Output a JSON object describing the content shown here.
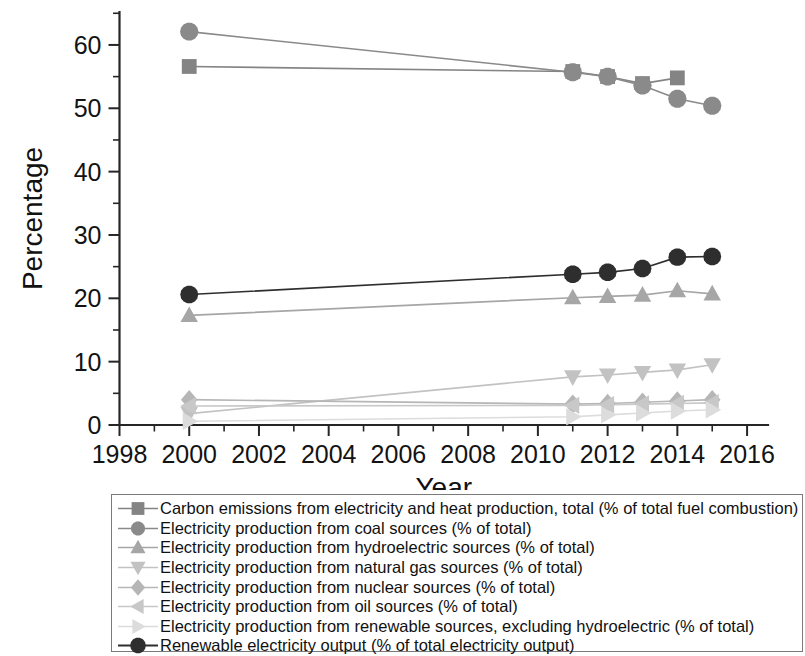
{
  "chart_data": {
    "type": "line",
    "title": "",
    "xlabel": "Year",
    "ylabel": "Percentage",
    "xlim": [
      1998,
      2016.6
    ],
    "ylim": [
      0,
      65.2
    ],
    "xticks": [
      1998,
      2000,
      2002,
      2004,
      2006,
      2008,
      2010,
      2012,
      2014,
      2016
    ],
    "xticklabels": [
      "1998",
      "2000",
      "2002",
      "2004",
      "2006",
      "2008",
      "2010",
      "2012",
      "2014",
      "2016"
    ],
    "xminorticks": [
      1999,
      2001,
      2003,
      2005,
      2007,
      2009,
      2011,
      2013,
      2015
    ],
    "yticks": [
      0,
      10,
      20,
      30,
      40,
      50,
      60
    ],
    "yticklabels": [
      "0",
      "10",
      "20",
      "30",
      "40",
      "50",
      "60"
    ],
    "yminorticks": [
      5,
      15,
      25,
      35,
      45,
      55,
      65
    ],
    "grid": false,
    "legend_position": "below-plot",
    "x": [
      2000,
      2011,
      2012,
      2013,
      2014,
      2015
    ],
    "series": [
      {
        "name": "Carbon emissions from electricity and heat production, total (% of total fuel combustion)",
        "marker": "square",
        "color": "#848484",
        "values": [
          56.6,
          55.8,
          55.0,
          53.9,
          54.8,
          null
        ]
      },
      {
        "name": "Electricity production from coal sources (% of total)",
        "marker": "circle",
        "color": "#8a8a8a",
        "values": [
          62.1,
          55.7,
          55.0,
          53.6,
          51.5,
          50.4
        ]
      },
      {
        "name": "Electricity production from hydroelectric sources (% of total)",
        "marker": "triangle-up",
        "color": "#a6a6a6",
        "values": [
          17.3,
          20.1,
          20.3,
          20.5,
          21.2,
          20.7
        ]
      },
      {
        "name": "Electricity production from natural gas sources (% of total)",
        "marker": "triangle-down",
        "color": "#c2c2c2",
        "values": [
          1.8,
          7.6,
          7.9,
          8.3,
          8.7,
          9.5
        ]
      },
      {
        "name": "Electricity production from nuclear sources (% of total)",
        "marker": "diamond",
        "color": "#b6b6b6",
        "values": [
          4.0,
          3.3,
          3.4,
          3.6,
          3.8,
          4.0
        ]
      },
      {
        "name": "Electricity production from oil sources (% of total)",
        "marker": "triangle-left",
        "color": "#c8c8c8",
        "values": [
          3.0,
          3.1,
          3.2,
          3.3,
          3.4,
          3.5
        ]
      },
      {
        "name": "Electricity production from renewable sources, excluding hydroelectric (% of total)",
        "marker": "triangle-right",
        "color": "#dcdcdc",
        "values": [
          0.6,
          1.3,
          1.6,
          1.9,
          2.2,
          2.4
        ]
      },
      {
        "name": "Renewable electricity output (% of total electricity output)",
        "marker": "circle-filled",
        "color": "#2e2e2e",
        "values": [
          20.6,
          23.8,
          24.1,
          24.7,
          26.5,
          26.6
        ]
      }
    ]
  },
  "legend": {
    "items": [
      "Carbon emissions from electricity and heat production, total (% of total fuel combustion)",
      "Electricity production from coal sources (% of total)",
      "Electricity production from hydroelectric sources (% of total)",
      "Electricity production from natural gas sources (% of total)",
      "Electricity production from nuclear sources (% of total)",
      "Electricity production from oil sources (% of total)",
      "Electricity production from renewable sources, excluding hydroelectric (% of total)",
      "Renewable electricity output (% of total electricity output)"
    ]
  }
}
